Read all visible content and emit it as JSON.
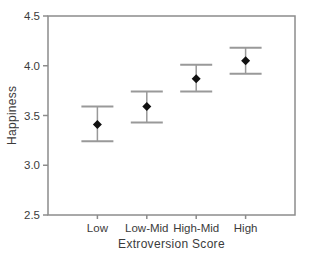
{
  "chart_data": {
    "type": "scatter",
    "subtype": "error-bar",
    "title": "",
    "xlabel": "Extroversion Score",
    "ylabel": "Happiness",
    "categories": [
      "Low",
      "Low-Mid",
      "High-Mid",
      "High"
    ],
    "series": [
      {
        "name": "Happiness mean",
        "values": [
          3.41,
          3.59,
          3.87,
          4.05
        ],
        "error_low": [
          3.24,
          3.43,
          3.74,
          3.92
        ],
        "error_high": [
          3.59,
          3.74,
          4.01,
          4.18
        ]
      }
    ],
    "ylim": [
      2.5,
      4.5
    ],
    "yticks": [
      2.5,
      3.0,
      3.5,
      4.0,
      4.5
    ],
    "grid": false,
    "legend": "none",
    "marker": "diamond",
    "colors": {
      "marker": "#111111",
      "error_bar": "#999999",
      "frame": "#8c8c8c",
      "text": "#3b3b3b",
      "background": "#ffffff"
    }
  }
}
